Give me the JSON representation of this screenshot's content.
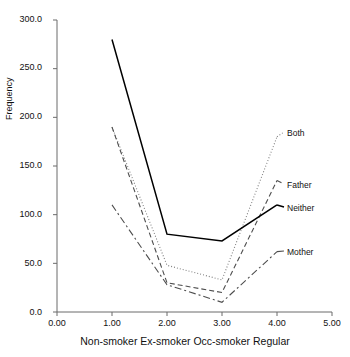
{
  "title": "",
  "axes": {
    "ylabel": "Frequency",
    "xlabel": "Non-smoker Ex-smoker Occ-smoker Regular",
    "yticks": [
      "0.0",
      "50.0",
      "100.0",
      "150.0",
      "200.0",
      "250.0",
      "300.0"
    ],
    "xticks": [
      "0.00",
      "1.00",
      "2.00",
      "3.00",
      "4.00",
      "5.00"
    ]
  },
  "legend": {
    "both": "Both",
    "father": "Father",
    "neither": "Neither",
    "mother": "Mother"
  },
  "chart_data": {
    "type": "line",
    "title": "",
    "xlabel": "Non-smoker Ex-smoker Occ-smoker Regular",
    "ylabel": "Frequency",
    "xlim": [
      0.0,
      5.0
    ],
    "ylim": [
      0.0,
      300.0
    ],
    "xticks": [
      0.0,
      1.0,
      2.0,
      3.0,
      4.0,
      5.0
    ],
    "yticks": [
      0.0,
      50.0,
      100.0,
      150.0,
      200.0,
      250.0,
      300.0
    ],
    "grid": false,
    "legend_position": "right-inline",
    "x": [
      1.0,
      2.0,
      3.0,
      4.0
    ],
    "series": [
      {
        "name": "Both",
        "style": "dotted",
        "color": "#808080",
        "values": [
          190,
          48,
          33,
          180
        ]
      },
      {
        "name": "Father",
        "style": "dashed",
        "color": "#4d4d4d",
        "values": [
          190,
          30,
          20,
          135
        ]
      },
      {
        "name": "Neither",
        "style": "solid",
        "color": "#000000",
        "values": [
          280,
          80,
          73,
          110
        ]
      },
      {
        "name": "Mother",
        "style": "dashdot",
        "color": "#4d4d4d",
        "values": [
          110,
          28,
          10,
          62
        ]
      }
    ]
  }
}
